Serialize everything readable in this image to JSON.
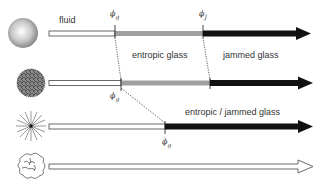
{
  "diagram": {
    "labels": {
      "fluid": "fluid",
      "entropic_glass": "entropic glass",
      "jammed_glass": "jammed glass",
      "entropic_jammed_glass": "entropic / jammed glass"
    },
    "symbols": {
      "phi": "ϕ",
      "sub_g": "g",
      "sub_J": "J"
    },
    "rows": [
      {
        "particle": "hard-sphere",
        "segments": [
          "fluid",
          "entropic glass",
          "jammed glass"
        ],
        "transitions": [
          "ϕg",
          "ϕJ"
        ]
      },
      {
        "particle": "soft-fuzzy-sphere",
        "segments": [
          "fluid",
          "entropic glass",
          "jammed glass"
        ],
        "transitions": [
          "ϕg",
          "ϕJ"
        ]
      },
      {
        "particle": "star-polymer",
        "segments": [
          "fluid",
          "entropic / jammed glass"
        ],
        "transitions": [
          "ϕg"
        ]
      },
      {
        "particle": "microgel",
        "segments": [
          "fluid"
        ],
        "transitions": []
      }
    ],
    "colors": {
      "fluid_bar": "#ffffff",
      "entropic_bar": "#a0a0a0",
      "jammed_bar": "#111111",
      "outline": "#333333"
    }
  }
}
